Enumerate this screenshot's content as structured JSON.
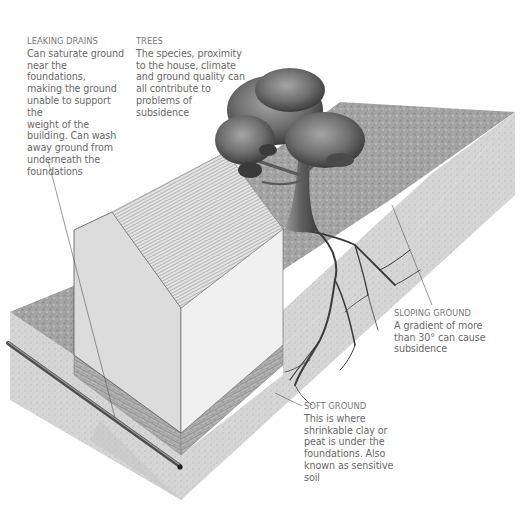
{
  "diagram": {
    "colors": {
      "text": "#6a6a6a",
      "ground_top": "#9a9a9a",
      "ground_side": "#d9d9d9",
      "wall_gable": "#dcdcdc",
      "wall_side": "#efefef",
      "brick": "#9c9c9c",
      "roof": "#c8c8c8",
      "tree_canopy": "#6e6e6e",
      "roots": "#3c3c3c",
      "pipe": "#6a6a6a"
    },
    "labels": {
      "leaking_drains": {
        "title": "LEAKING DRAINS",
        "body": "Can saturate ground\nnear the foundations,\nmaking the ground\nunable to support the\nweight of the\nbuilding. Can wash\naway ground from\nunderneath the\nfoundations"
      },
      "trees": {
        "title": "TREES",
        "body": "The species, proximity\nto the house, climate\nand ground quality can\nall contribute to\nproblems of subsidence"
      },
      "sloping_ground": {
        "title": "SLOPING GROUND",
        "body": "A gradient of more\nthan 30° can cause\nsubsidence"
      },
      "soft_ground": {
        "title": "SOFT GROUND",
        "body": "This is where\nshrinkable clay or\npeat is under the\nfoundations. Also\nknown as sensitive\nsoil"
      }
    },
    "components": [
      "house",
      "roof",
      "brick-foundation",
      "drain-pipe",
      "tree",
      "roots",
      "sloping-ground",
      "ground-slab"
    ]
  }
}
